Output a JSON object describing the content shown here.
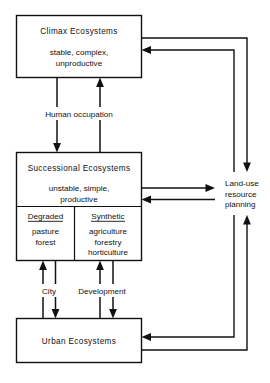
{
  "diagram": {
    "type": "flow-diagram",
    "title_text": "",
    "colors": {
      "stroke": "#111111",
      "background": "#ffffff"
    },
    "nodes": {
      "climax": {
        "title": "Climax  Ecosystems",
        "attributes": [
          "stable, complex,",
          "unproductive"
        ]
      },
      "successional": {
        "title": "Successional  Ecosystems",
        "attributes": [
          "unstable, simple,",
          "productive"
        ],
        "subnodes": [
          {
            "heading": "Degraded",
            "items": [
              "pasture",
              "forest"
            ]
          },
          {
            "heading": "Synthetic",
            "items": [
              "agriculture",
              "forestry",
              "horticulture"
            ]
          }
        ]
      },
      "urban": {
        "title": "Urban  Ecosystems"
      },
      "landuse": {
        "lines": [
          "Land-use",
          "resource",
          "planning"
        ]
      }
    },
    "edge_labels": {
      "human_occupation": "Human occupation",
      "city": "City",
      "development": "Development"
    },
    "connections": [
      {
        "name": "climax-to-successional",
        "label": "Human occupation",
        "direction": "down"
      },
      {
        "name": "successional-to-climax",
        "label": "Human occupation",
        "direction": "up"
      },
      {
        "name": "successional-sub-to-urban",
        "label": "City",
        "direction": "down"
      },
      {
        "name": "urban-to-successional-sub",
        "label": "City",
        "direction": "up"
      },
      {
        "name": "synthetic-to-urban",
        "label": "Development",
        "direction": "down"
      },
      {
        "name": "urban-to-synthetic",
        "label": "Development",
        "direction": "up"
      },
      {
        "name": "successional-to-landuse",
        "direction": "right"
      },
      {
        "name": "landuse-to-successional",
        "direction": "left"
      },
      {
        "name": "climax-to-landuse",
        "direction": "down-right"
      },
      {
        "name": "landuse-to-climax",
        "direction": "left-arrow"
      },
      {
        "name": "urban-to-landuse",
        "direction": "up-right"
      },
      {
        "name": "landuse-to-urban",
        "direction": "left-arrow"
      }
    ]
  }
}
